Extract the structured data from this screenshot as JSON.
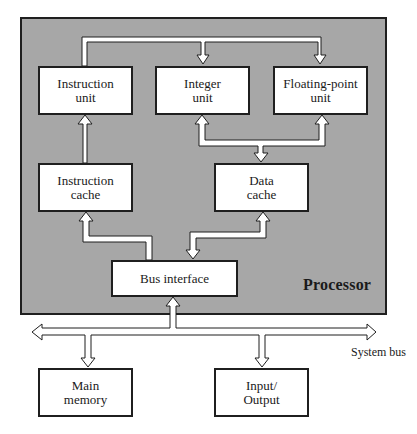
{
  "diagram": {
    "processor_label": "Processor",
    "system_bus_label": "System bus",
    "colors": {
      "processor_fill": "#a7a7a7",
      "box_fill": "#ffffff",
      "border": "#1f1f1f",
      "arrow_fill": "#ffffff"
    },
    "blocks": {
      "instruction_unit": "Instruction\nunit",
      "integer_unit": "Integer\nunit",
      "floating_point_unit": "Floating-point\nunit",
      "instruction_cache": "Instruction\ncache",
      "data_cache": "Data\ncache",
      "bus_interface": "Bus interface",
      "main_memory": "Main\nmemory",
      "input_output": "Input/\nOutput"
    },
    "connections": [
      {
        "from": "instruction_unit",
        "to": "integer_unit",
        "direction": "one-way"
      },
      {
        "from": "instruction_unit",
        "to": "floating_point_unit",
        "direction": "one-way"
      },
      {
        "from": "instruction_cache",
        "to": "instruction_unit",
        "direction": "one-way"
      },
      {
        "from": "data_cache",
        "to": "integer_unit",
        "direction": "two-way"
      },
      {
        "from": "data_cache",
        "to": "floating_point_unit",
        "direction": "two-way"
      },
      {
        "from": "bus_interface",
        "to": "instruction_cache",
        "direction": "one-way"
      },
      {
        "from": "bus_interface",
        "to": "data_cache",
        "direction": "two-way"
      },
      {
        "from": "system_bus",
        "to": "bus_interface",
        "direction": "two-way"
      },
      {
        "from": "system_bus",
        "to": "main_memory",
        "direction": "two-way"
      },
      {
        "from": "system_bus",
        "to": "input_output",
        "direction": "two-way"
      }
    ]
  }
}
